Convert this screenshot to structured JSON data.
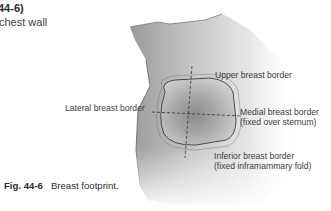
{
  "header": {
    "fig_ref": "44-6)",
    "subtitle": "chest wall"
  },
  "figure": {
    "labels": {
      "upper": "Upper breast border",
      "lateral": "Lateral breast border",
      "medial_line1": "Medial breast border",
      "medial_line2": "(fixed over sternum)",
      "inferior_line1": "Inferior breast border",
      "inferior_line2": "(fixed inframammary fold)"
    },
    "colors": {
      "skin_dark": "#8f8f8f",
      "skin_mid": "#b9b9b9",
      "skin_light": "#e2e2e2",
      "outline": "#4a4a4a",
      "dashed": "#333333"
    }
  },
  "caption": {
    "fig_label": "Fig. 44-6",
    "text": "Breast footprint."
  }
}
